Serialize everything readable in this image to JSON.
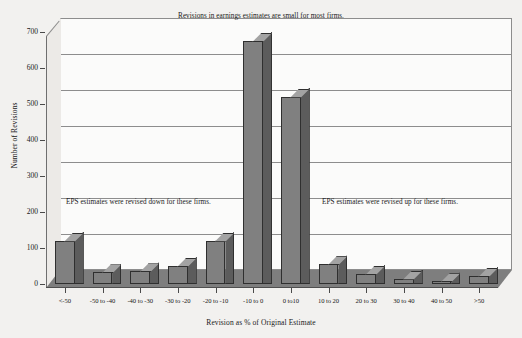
{
  "chart_data": {
    "type": "bar",
    "title": "",
    "xlabel": "Revision as % of Original Estimate",
    "ylabel": "Number of Revisions",
    "ylim": [
      0,
      700
    ],
    "yticks": [
      0,
      100,
      200,
      300,
      400,
      500,
      600,
      700
    ],
    "grid": true,
    "legend": "none",
    "style": "3d-column",
    "categories": [
      "<-50",
      "-50 to -40",
      "-40 to -30",
      "-30 to -20",
      "-20 to -10",
      "-10 to 0",
      "0 to10",
      "10 to 20",
      "20 to 30",
      "30 to 40",
      "40 to 50",
      ">50"
    ],
    "values": [
      120,
      32,
      35,
      50,
      120,
      675,
      520,
      55,
      28,
      15,
      8,
      22
    ],
    "annotations": [
      "Revisions in earnings estimates are small for most firms.",
      "EPS estimates were revised down for these firms.",
      "EPS estimates were revised up for these firms."
    ]
  },
  "colors": {
    "background": "#f2f1ef",
    "plot_face": "#fbfbfa",
    "bar_front": "#808080",
    "bar_side": "#5c5c5c",
    "bar_top": "#a3a3a3",
    "floor": "#7e7e7e",
    "gridline": "#8d8d8d",
    "text": "#1a1a1a"
  }
}
